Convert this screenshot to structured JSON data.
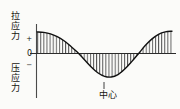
{
  "figure": {
    "labels": {
      "tensile": "拉应力",
      "tensile_chars": [
        "拉",
        "应",
        "力"
      ],
      "compressive": "压应力",
      "compressive_chars": [
        "压",
        "应",
        "力"
      ],
      "center": "中心",
      "axis_plus": "+",
      "axis_zero": "0",
      "axis_minus": "−"
    },
    "colors": {
      "background": "#fbfbf9",
      "ink": "#16140f",
      "curve": "#111111",
      "hatch": "#555555",
      "axis": "#444444"
    }
  },
  "chart_data": {
    "type": "line",
    "title": "",
    "xlabel": "中心",
    "ylabel": "拉应力 / 压应力",
    "ytick_labels": [
      "+",
      "0",
      "−"
    ],
    "ytick_values": [
      1,
      0,
      -1
    ],
    "xlim": [
      0,
      1
    ],
    "ylim": [
      -1.25,
      1.25
    ],
    "grid": false,
    "legend_position": "none",
    "fill": "hatched-vertical-lines",
    "annotations": [
      {
        "text": "拉应力",
        "position": "top-left-axis"
      },
      {
        "text": "压应力",
        "position": "bottom-left-axis"
      },
      {
        "text": "中心",
        "position": "bottom-center",
        "x": 0.5
      }
    ],
    "series": [
      {
        "name": "stress",
        "x": [
          0.0,
          0.05,
          0.1,
          0.15,
          0.2,
          0.25,
          0.3,
          0.35,
          0.4,
          0.45,
          0.5,
          0.55,
          0.6,
          0.65,
          0.7,
          0.75,
          0.8,
          0.85,
          0.9,
          0.95,
          1.0
        ],
        "y": [
          0.9,
          0.88,
          0.82,
          0.7,
          0.53,
          0.3,
          0.05,
          -0.25,
          -0.55,
          -0.8,
          -0.95,
          -0.98,
          -0.88,
          -0.65,
          -0.35,
          -0.02,
          0.32,
          0.6,
          0.8,
          0.9,
          0.93
        ]
      }
    ]
  }
}
